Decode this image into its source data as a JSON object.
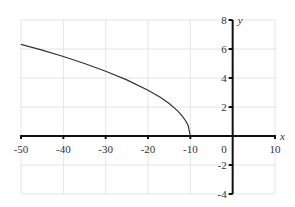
{
  "chart_data": {
    "type": "line",
    "title": "",
    "xlabel": "x",
    "ylabel": "y",
    "xlim": [
      -50,
      10
    ],
    "ylim": [
      -4,
      8
    ],
    "grid": true,
    "x_ticks": [
      -50,
      -40,
      -30,
      -20,
      -10,
      10
    ],
    "x_tick_labels": [
      "-50",
      "-40",
      "-30",
      "-20",
      "-10",
      "10"
    ],
    "y_ticks": [
      -4,
      -2,
      2,
      4,
      6,
      8
    ],
    "y_tick_labels": [
      "-4",
      "-2",
      "2",
      "4",
      "6",
      "8"
    ],
    "origin_label": "0",
    "series": [
      {
        "name": "y = sqrt(-x - 10)",
        "x": [
          -50,
          -45,
          -40,
          -35,
          -30,
          -25,
          -20,
          -17,
          -15,
          -13,
          -12,
          -11,
          -10.5,
          -10
        ],
        "y": [
          6.32,
          5.92,
          5.48,
          5.0,
          4.47,
          3.87,
          3.16,
          2.65,
          2.24,
          1.73,
          1.41,
          1.0,
          0.71,
          0
        ],
        "color": "#333333"
      }
    ]
  }
}
